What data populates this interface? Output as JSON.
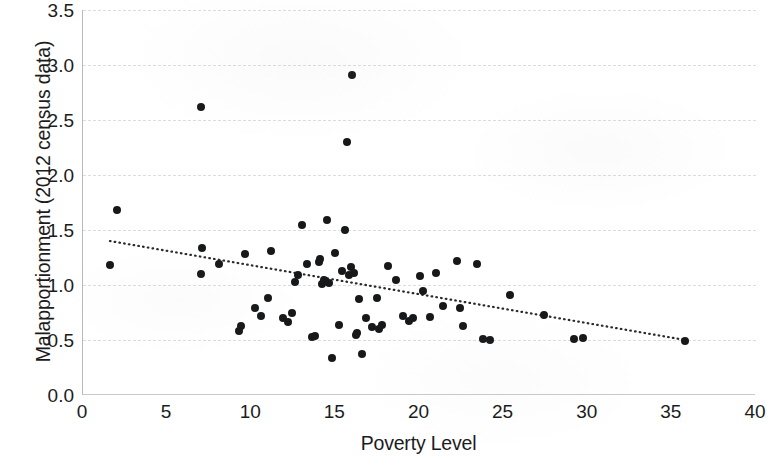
{
  "chart_data": {
    "type": "scatter",
    "title": "",
    "xlabel": "Poverty Level",
    "ylabel": "Malapportionment (2012 census data)",
    "xlim": [
      0,
      40
    ],
    "ylim": [
      0.0,
      3.5
    ],
    "xticks": [
      "0",
      "5",
      "10",
      "15",
      "20",
      "25",
      "30",
      "35",
      "40"
    ],
    "xtick_values": [
      0,
      5,
      10,
      15,
      20,
      25,
      30,
      35,
      40
    ],
    "yticks": [
      "0.0",
      "0.5",
      "1.0",
      "1.5",
      "2.0",
      "2.5",
      "3.0",
      "3.5"
    ],
    "ytick_values": [
      0.0,
      0.5,
      1.0,
      1.5,
      2.0,
      2.5,
      3.0,
      3.5
    ],
    "grid": "horizontal-dashed",
    "legend": "none",
    "marker_color": "#16181a",
    "marker_size": 8,
    "points": [
      [
        1.6,
        1.18
      ],
      [
        2.0,
        1.68
      ],
      [
        7.0,
        2.62
      ],
      [
        7.1,
        1.34
      ],
      [
        7.0,
        1.1
      ],
      [
        8.1,
        1.19
      ],
      [
        9.3,
        0.58
      ],
      [
        9.4,
        0.63
      ],
      [
        9.6,
        1.28
      ],
      [
        10.2,
        0.79
      ],
      [
        10.6,
        0.72
      ],
      [
        11.0,
        0.88
      ],
      [
        11.2,
        1.31
      ],
      [
        11.9,
        0.7
      ],
      [
        12.2,
        0.66
      ],
      [
        12.4,
        0.75
      ],
      [
        12.6,
        1.03
      ],
      [
        12.8,
        1.09
      ],
      [
        13.0,
        1.55
      ],
      [
        13.3,
        1.19
      ],
      [
        13.6,
        0.53
      ],
      [
        13.8,
        0.54
      ],
      [
        14.0,
        1.21
      ],
      [
        14.1,
        1.24
      ],
      [
        14.2,
        1.01
      ],
      [
        14.3,
        1.05
      ],
      [
        14.5,
        1.59
      ],
      [
        14.6,
        1.02
      ],
      [
        14.8,
        0.34
      ],
      [
        15.0,
        1.29
      ],
      [
        15.2,
        0.64
      ],
      [
        15.4,
        1.13
      ],
      [
        15.6,
        1.5
      ],
      [
        15.8,
        1.09
      ],
      [
        15.9,
        1.16
      ],
      [
        16.0,
        2.91
      ],
      [
        16.1,
        1.11
      ],
      [
        16.2,
        0.55
      ],
      [
        16.3,
        0.56
      ],
      [
        16.4,
        0.87
      ],
      [
        15.7,
        2.3
      ],
      [
        16.6,
        0.37
      ],
      [
        16.8,
        0.7
      ],
      [
        17.2,
        0.62
      ],
      [
        17.5,
        0.88
      ],
      [
        17.6,
        0.6
      ],
      [
        17.8,
        0.64
      ],
      [
        18.1,
        1.17
      ],
      [
        18.6,
        1.05
      ],
      [
        19.0,
        0.72
      ],
      [
        19.4,
        0.67
      ],
      [
        19.6,
        0.7
      ],
      [
        20.0,
        1.08
      ],
      [
        20.2,
        0.95
      ],
      [
        20.6,
        0.71
      ],
      [
        21.0,
        1.11
      ],
      [
        21.4,
        0.81
      ],
      [
        22.2,
        1.22
      ],
      [
        22.4,
        0.79
      ],
      [
        22.6,
        0.63
      ],
      [
        23.4,
        1.19
      ],
      [
        23.8,
        0.51
      ],
      [
        24.2,
        0.5
      ],
      [
        25.4,
        0.91
      ],
      [
        27.4,
        0.73
      ],
      [
        29.2,
        0.51
      ],
      [
        29.7,
        0.52
      ],
      [
        35.8,
        0.49
      ]
    ],
    "trendline": {
      "style": "dotted",
      "color": "#2a2a2a",
      "x_start": 1.6,
      "y_start": 1.4,
      "x_end": 35.8,
      "y_end": 0.5
    }
  }
}
